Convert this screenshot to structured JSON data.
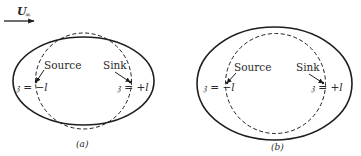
{
  "freestream": {
    "label": "U",
    "subscript": "∞"
  },
  "panels": [
    {
      "caption": "(a)",
      "source_label": "Source",
      "sink_label": "Sink",
      "source_position": "𝔷 = −l",
      "sink_position": "𝔷 = +l",
      "body_shape": "ellipse (Rankine oval, elongated)",
      "dashed_reference": "circle"
    },
    {
      "caption": "(b)",
      "source_label": "Source",
      "sink_label": "Sink",
      "source_position": "𝔷 = −l",
      "sink_position": "𝔷 = +l",
      "body_shape": "ellipse (larger, encloses circle)",
      "dashed_reference": "circle"
    }
  ],
  "colors": {
    "line": "#1e1e1e",
    "text": "#2a2a2a",
    "background": "#ffffff"
  }
}
